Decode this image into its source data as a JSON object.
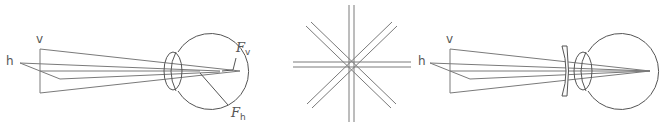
{
  "figure": {
    "panels": [
      {
        "id": "astigmatic-eye",
        "labels": {
          "vertical": "v",
          "horizontal": "h",
          "focus_vertical": "F",
          "focus_vertical_sub": "v",
          "focus_horizontal": "F",
          "focus_horizontal_sub": "h"
        }
      },
      {
        "id": "astigmatism-test-chart",
        "labels": {}
      },
      {
        "id": "corrected-eye",
        "labels": {
          "vertical": "v",
          "horizontal": "h"
        }
      }
    ],
    "colors": {
      "line": "#7a7a7a",
      "outline": "#555555",
      "background": "#ffffff"
    }
  }
}
